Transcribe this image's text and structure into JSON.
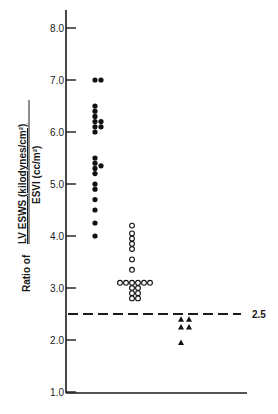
{
  "chart_data": {
    "type": "scatter",
    "title": "",
    "xlabel": "",
    "ylabel": {
      "prefix": "Ratio of",
      "numerator": "LV ESWS (kilodynes/cm²)",
      "denominator": "ESVI (cc/m²)"
    },
    "ylim": [
      1.0,
      8.3
    ],
    "yticks": [
      "1.0",
      "2.0",
      "3.0",
      "4.0",
      "5.0",
      "6.0",
      "7.0",
      "8.0"
    ],
    "grid": false,
    "legend": null,
    "reference_line": {
      "y": 2.5,
      "label": "2.5",
      "style": "dashed"
    },
    "series": [
      {
        "name": "group-1",
        "marker": "filled-circle",
        "points": [
          {
            "col": 0,
            "y": 7.0
          },
          {
            "col": 1,
            "y": 7.0
          },
          {
            "col": 0,
            "y": 6.5
          },
          {
            "col": 0,
            "y": 6.4
          },
          {
            "col": 0,
            "y": 6.3
          },
          {
            "col": 1,
            "y": 6.2
          },
          {
            "col": 0,
            "y": 6.2
          },
          {
            "col": 0,
            "y": 6.1
          },
          {
            "col": 1,
            "y": 6.1
          },
          {
            "col": 0,
            "y": 6.0
          },
          {
            "col": 0,
            "y": 5.5
          },
          {
            "col": 0,
            "y": 5.4
          },
          {
            "col": 1,
            "y": 5.35
          },
          {
            "col": 0,
            "y": 5.3
          },
          {
            "col": 0,
            "y": 5.2
          },
          {
            "col": 0,
            "y": 5.0
          },
          {
            "col": 0,
            "y": 4.9
          },
          {
            "col": 0,
            "y": 4.7
          },
          {
            "col": 0,
            "y": 4.5
          },
          {
            "col": 0,
            "y": 4.25
          },
          {
            "col": 0,
            "y": 4.0
          }
        ]
      },
      {
        "name": "group-2",
        "marker": "open-circle",
        "points": [
          {
            "col": 0,
            "y": 4.2
          },
          {
            "col": 0,
            "y": 4.05
          },
          {
            "col": 0,
            "y": 3.95
          },
          {
            "col": 0,
            "y": 3.85
          },
          {
            "col": 0,
            "y": 3.75
          },
          {
            "col": 0,
            "y": 3.55
          },
          {
            "col": 0,
            "y": 3.35
          },
          {
            "col": -2,
            "y": 3.1
          },
          {
            "col": -1,
            "y": 3.1
          },
          {
            "col": 0,
            "y": 3.1
          },
          {
            "col": 1,
            "y": 3.1
          },
          {
            "col": 2,
            "y": 3.1
          },
          {
            "col": 3,
            "y": 3.1
          },
          {
            "col": 0,
            "y": 3.0
          },
          {
            "col": 1,
            "y": 3.0
          },
          {
            "col": 0,
            "y": 2.9
          },
          {
            "col": 1,
            "y": 2.9
          },
          {
            "col": 0,
            "y": 2.8
          },
          {
            "col": 1,
            "y": 2.8
          }
        ]
      },
      {
        "name": "group-3",
        "marker": "filled-triangle",
        "points": [
          {
            "col": 0,
            "y": 2.4
          },
          {
            "col": 1,
            "y": 2.4
          },
          {
            "col": 0,
            "y": 2.25
          },
          {
            "col": 1,
            "y": 2.25
          },
          {
            "col": 0,
            "y": 1.95
          }
        ]
      }
    ]
  }
}
